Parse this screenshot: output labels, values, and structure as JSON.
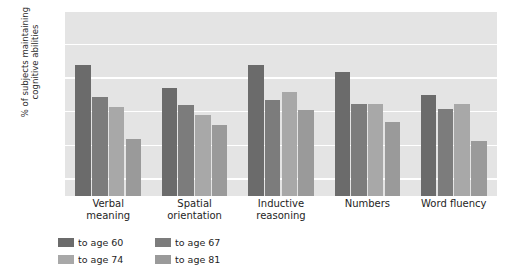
{
  "chart_data": {
    "type": "bar",
    "title": "",
    "xlabel": "",
    "ylabel": "% of subjects maintaining cognitive abilities",
    "ylim": [
      45,
      100
    ],
    "yticks": [
      50,
      60,
      70,
      80,
      90,
      100
    ],
    "grid": true,
    "legend_position": "bottom-left",
    "categories": [
      "Verbal\nmeaning",
      "Spatial\norientation",
      "Inductive\nreasoning",
      "Numbers",
      "Word fluency"
    ],
    "series": [
      {
        "name": "to age 60",
        "color": "#6b6b6b",
        "values": [
          84,
          77,
          84,
          82,
          75
        ]
      },
      {
        "name": "to age 67",
        "color": "#7c7c7c",
        "values": [
          74.5,
          72,
          73.5,
          72.5,
          71
        ]
      },
      {
        "name": "to age 74",
        "color": "#a8a8a8",
        "values": [
          71.5,
          69,
          76,
          72.5,
          72.5
        ]
      },
      {
        "name": "to age 81",
        "color": "#9a9a9a",
        "values": [
          62,
          66,
          70.5,
          67,
          61.5
        ]
      }
    ]
  },
  "axis": {
    "y_title_line1": "% of subjects maintaining",
    "y_title_line2": "cognitive abilities",
    "tick_labels": [
      "100",
      "90",
      "80",
      "70",
      "60",
      "50"
    ]
  },
  "colors": {
    "plot_background": "#e4e4e4",
    "gridline": "#ffffff",
    "page_background": "#ffffff",
    "text": "#1e1e1e"
  },
  "legend": {
    "items": [
      {
        "label": "to age 60",
        "color": "#6b6b6b"
      },
      {
        "label": "to age 67",
        "color": "#7c7c7c"
      },
      {
        "label": "to age 74",
        "color": "#a8a8a8"
      },
      {
        "label": "to age 81",
        "color": "#9a9a9a"
      }
    ]
  }
}
